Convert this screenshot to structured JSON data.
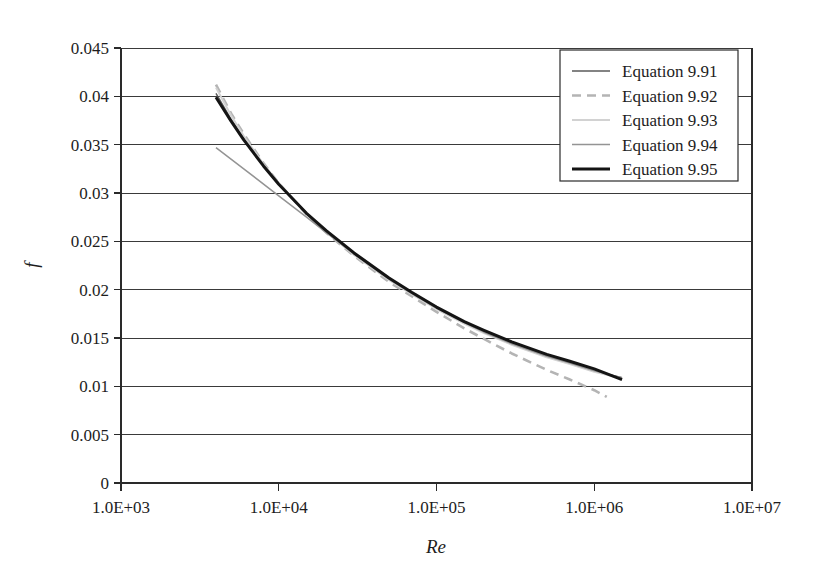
{
  "chart_data": {
    "type": "line",
    "title": "",
    "xlabel": "Re",
    "ylabel": "f",
    "xscale": "log",
    "xlim": [
      1000,
      10000000
    ],
    "ylim": [
      0,
      0.045
    ],
    "grid": "horizontal",
    "legend_position": "top-right",
    "xtick_labels": [
      "1.0E+03",
      "1.0E+04",
      "1.0E+05",
      "1.0E+06",
      "1.0E+07"
    ],
    "xtick_values": [
      1000,
      10000,
      100000,
      1000000,
      10000000
    ],
    "ytick_labels": [
      "0",
      "0.005",
      "0.01",
      "0.015",
      "0.02",
      "0.025",
      "0.03",
      "0.035",
      "0.04",
      "0.045"
    ],
    "ytick_values": [
      0,
      0.005,
      0.01,
      0.015,
      0.02,
      0.025,
      0.03,
      0.035,
      0.04,
      0.045
    ],
    "series": [
      {
        "name": "Equation 9.91",
        "color": "#5a5a5a",
        "width": 1.5,
        "dash": "none",
        "x": [
          4000,
          5000,
          6000,
          8000,
          10000,
          15000,
          20000,
          30000,
          50000,
          70000,
          100000,
          150000,
          200000,
          300000,
          500000,
          700000,
          1000000,
          1500000
        ],
        "y": [
          0.0403,
          0.0376,
          0.0357,
          0.0329,
          0.031,
          0.0279,
          0.026,
          0.0237,
          0.0211,
          0.0196,
          0.0181,
          0.0166,
          0.0156,
          0.0144,
          0.0131,
          0.0124,
          0.0116,
          0.0109
        ]
      },
      {
        "name": "Equation 9.92",
        "color": "#b4b4b4",
        "width": 2.6,
        "dash": "dashed",
        "x": [
          4000,
          5000,
          6000,
          8000,
          10000,
          15000,
          20000,
          30000,
          50000,
          70000,
          100000,
          150000,
          200000,
          300000,
          500000,
          700000,
          1000000,
          1200000
        ],
        "y": [
          0.0412,
          0.0382,
          0.0361,
          0.0331,
          0.031,
          0.0278,
          0.0259,
          0.0235,
          0.0208,
          0.0193,
          0.0177,
          0.016,
          0.0149,
          0.0134,
          0.0117,
          0.0107,
          0.0096,
          0.0089
        ]
      },
      {
        "name": "Equation 9.93",
        "color": "#d2d2d2",
        "width": 2.0,
        "dash": "none",
        "x": [
          4000,
          5000,
          6000,
          8000,
          10000,
          15000,
          20000,
          30000,
          50000,
          70000,
          100000,
          150000,
          200000,
          300000,
          500000,
          700000,
          1000000,
          1500000
        ],
        "y": [
          0.0409,
          0.038,
          0.0359,
          0.033,
          0.031,
          0.0279,
          0.026,
          0.0236,
          0.021,
          0.0195,
          0.018,
          0.0165,
          0.0155,
          0.0143,
          0.013,
          0.0123,
          0.0115,
          0.0108
        ]
      },
      {
        "name": "Equation 9.94",
        "color": "#949494",
        "width": 1.5,
        "dash": "none",
        "x": [
          4000,
          6000,
          10000,
          15000,
          20000,
          30000,
          50000,
          70000,
          100000,
          150000,
          200000,
          300000,
          500000,
          700000,
          1000000,
          1500000
        ],
        "y": [
          0.0347,
          0.0325,
          0.0297,
          0.0275,
          0.0259,
          0.0237,
          0.0211,
          0.0196,
          0.0181,
          0.0166,
          0.0156,
          0.0144,
          0.0131,
          0.0124,
          0.0116,
          0.0109
        ]
      },
      {
        "name": "Equation 9.95",
        "color": "#141414",
        "width": 3.0,
        "dash": "none",
        "x": [
          4000,
          5000,
          6000,
          8000,
          10000,
          15000,
          20000,
          30000,
          50000,
          70000,
          100000,
          150000,
          200000,
          300000,
          500000,
          700000,
          1000000,
          1500000
        ],
        "y": [
          0.0399,
          0.0374,
          0.0355,
          0.0328,
          0.0309,
          0.0279,
          0.0261,
          0.0238,
          0.0212,
          0.0197,
          0.0182,
          0.0167,
          0.0158,
          0.0146,
          0.0133,
          0.0126,
          0.0118,
          0.0107
        ]
      }
    ]
  },
  "legend": {
    "items": [
      {
        "label": "Equation 9.91"
      },
      {
        "label": "Equation 9.92"
      },
      {
        "label": "Equation 9.93"
      },
      {
        "label": "Equation 9.94"
      },
      {
        "label": "Equation 9.95"
      }
    ]
  },
  "axes": {
    "x_title": "Re",
    "y_title": "f"
  }
}
